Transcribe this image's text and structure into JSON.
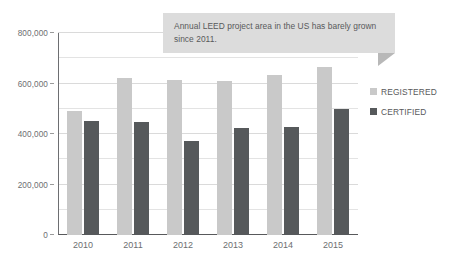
{
  "chart_data": {
    "type": "bar",
    "title": "",
    "xlabel": "",
    "ylabel": "",
    "categories": [
      "2010",
      "2011",
      "2012",
      "2013",
      "2014",
      "2015"
    ],
    "series": [
      {
        "name": "REGISTERED",
        "color": "#c9c9c9",
        "values": [
          490000,
          620000,
          613000,
          608000,
          633000,
          665000
        ]
      },
      {
        "name": "CERTIFIED",
        "color": "#56595b",
        "values": [
          452000,
          446000,
          373000,
          422000,
          427000,
          500000
        ]
      }
    ],
    "ylim": [
      0,
      800000
    ],
    "y_ticks": [
      0,
      200000,
      400000,
      600000,
      800000
    ],
    "y_tick_labels": [
      "0",
      "200,000",
      "400,000",
      "600,000",
      "800,000"
    ],
    "y_minor_step": 100000,
    "grid": true,
    "legend_position": "right"
  },
  "annotation": {
    "text": "Annual LEED project area in the US has barely grown since 2011.",
    "background": "#dcdcdc",
    "tail_color": "#b8b8b8"
  },
  "legend": {
    "items": [
      {
        "label": "REGISTERED",
        "color": "#c9c9c9"
      },
      {
        "label": "CERTIFIED",
        "color": "#56595b"
      }
    ]
  }
}
